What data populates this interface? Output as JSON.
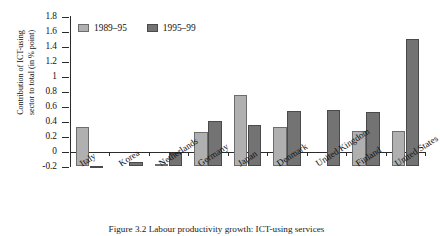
{
  "chart_data": {
    "type": "bar",
    "title": "",
    "xlabel": "",
    "ylabel": "Contribution of ICT-using\nsector to total (in % point)",
    "ylim": [
      -0.2,
      1.8
    ],
    "ytick_labels": [
      "1.8",
      "1.6",
      "1.4",
      "1.2",
      "1",
      "0.8",
      "0.6",
      "0.4",
      "0.2",
      "0",
      "-0.2"
    ],
    "ytick_values": [
      1.8,
      1.6,
      1.4,
      1.2,
      1.0,
      0.8,
      0.6,
      0.4,
      0.2,
      0.0,
      -0.2
    ],
    "grid": false,
    "legend_position": "top-left-inside",
    "categories": [
      "Italy",
      "Korea",
      "Netherlands",
      "Germany",
      "Japan",
      "Denmark",
      "United Kingdom",
      "Finland",
      "United States"
    ],
    "series": [
      {
        "name": "1989–95",
        "color": "#b0b0b0",
        "values": [
          0.52,
          0.0,
          0.02,
          0.45,
          0.95,
          0.52,
          0.0,
          0.47,
          0.47
        ]
      },
      {
        "name": "1995–99",
        "color": "#737373",
        "values": [
          -0.02,
          0.05,
          0.17,
          0.6,
          0.55,
          0.73,
          0.75,
          0.72,
          1.7
        ]
      }
    ]
  },
  "caption": "Figure 3.2  Labour productivity growth: ICT-using services"
}
